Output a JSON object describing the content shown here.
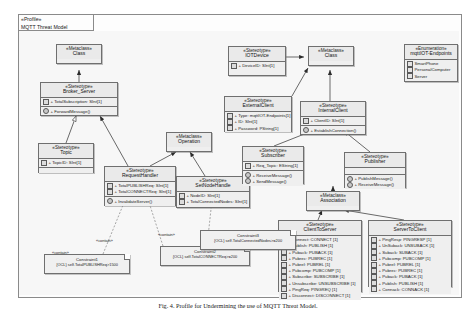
{
  "diagram": {
    "profile_label": "«Profile»",
    "profile_name": "MQTT Threat Model",
    "caption": "Fig. 4.  Profile for Undermining the use of MQTT Threat Model."
  },
  "labels": {
    "contain_1": "«contain»",
    "contain_2": "«contain»",
    "contain_3": "«contain»"
  },
  "boxes": {
    "metaclass_class_top": {
      "stereotype": "«Metaclass»",
      "name": "Class"
    },
    "metaclass_class_right": {
      "stereotype": "«Metaclass»",
      "name": "Class"
    },
    "metaclass_operation": {
      "stereotype": "«Metaclass»",
      "name": "Operation"
    },
    "metaclass_association": {
      "stereotype": "«Metaclass»",
      "name": "Association"
    },
    "broker_server": {
      "stereotype": "«Stereotype»",
      "name": "Broker_Server",
      "attributes": [
        "+ TotalSubscription: SInt[1]"
      ],
      "operations": [
        "+ ForwardMessage()"
      ]
    },
    "topic": {
      "stereotype": "«Stereotype»",
      "name": "Topic",
      "attributes": [
        "+ TopicID: SInt[1]"
      ],
      "operations": []
    },
    "request_handler": {
      "stereotype": "«Stereotype»",
      "name": "RequestHandler",
      "attributes": [
        "+ TotalPUBLISHReq: SInt[1]",
        "+ TotalCONNECTReq: SInt[1]"
      ],
      "operations": [
        "+ InvalidateServer()"
      ]
    },
    "set_node_handle": {
      "stereotype": "«Stereotype»",
      "name": "SetNodeHandle",
      "attributes": [
        "+ NodeID: SInt[1]",
        "+ TotalConnectedNodes: SInt[1]"
      ],
      "operations": []
    },
    "iot_device": {
      "stereotype": "«Stereotype»",
      "name": "IOTDevice",
      "attributes": [
        "+ DeviceID: SInt[1]"
      ],
      "operations": []
    },
    "external_client": {
      "stereotype": "«Stereotype»",
      "name": "ExternalClient",
      "attributes": [
        "+ Type: mqttIOT-Endpoints[1]",
        "+ ID: SInt[1]",
        "+ Password: PString[1]"
      ],
      "operations": []
    },
    "internal_client": {
      "stereotype": "«Stereotype»",
      "name": "InternalClient",
      "attributes": [
        "+ ClientID: SInt[1]"
      ],
      "operations": [
        "+ EstablishConnection()"
      ]
    },
    "subscriber": {
      "stereotype": "«Stereotype»",
      "name": "Subscriber",
      "attributes": [
        "+ Req_Topic: EString[1]"
      ],
      "operations": [
        "+ ReceiveMessage()",
        "+ SendMessage()"
      ]
    },
    "publisher": {
      "stereotype": "«Stereotype»",
      "name": "Publisher",
      "attributes": [],
      "operations": [
        "+ PublishMessage()",
        "+ ReceiveMessage()"
      ]
    },
    "enumeration_endpoints": {
      "stereotype": "«Enumeration»",
      "name": "mqttIOT-Endpoints",
      "literals": [
        "SmartPhone",
        "PersonalComputer",
        "Server"
      ]
    },
    "client_to_server": {
      "stereotype": "«Stereotype»",
      "name": "ClientToServer",
      "attributes": [
        "+ Connect: CONNECT [1]",
        "+ Publish: PUBLISH [1]",
        "+ Puback: PUBACK [1]",
        "+ Pubrec: PUBREC [1]",
        "+ Pubrel: PUBREL [1]",
        "+ Pubcomp: PUBCOMP [1]",
        "+ Subscribe: SUBSCRIBE [1]",
        "+ Unsubscribe: UNSUBSCRIBE [1]",
        "+ PingReq: PINGREQ [1]",
        "+ Disconnect: DISCONNECT [1]"
      ]
    },
    "server_to_client": {
      "stereotype": "«Stereotype»",
      "name": "ServerToClient",
      "attributes": [
        "+ PingResp: PINGRESP [1]",
        "+ UnSuback: UNSUBACK [1]",
        "+ Suback: SUBACK [1]",
        "+ Pubcomp: PUBCOMP [1]",
        "+ Pubrel: PUBREL [1]",
        "+ Pubrec: PUBREC [1]",
        "+ Puback: PUBACK [1]",
        "+ Publish: PUBLISH [1]",
        "+ Connack: CONNACK [1]"
      ]
    }
  },
  "notes": {
    "constraint_1": {
      "title": "Constraint1",
      "body": "{OCL} self.TotalPUBLISHReq>1500"
    },
    "constraint_2": {
      "title": "Constraint2",
      "body": "{OCL} self.TotalCONNECTReq>=200"
    },
    "constraint_3": {
      "title": "Constraint3",
      "body": "{OCL} self.TotalConnectedNodes>=200"
    }
  }
}
